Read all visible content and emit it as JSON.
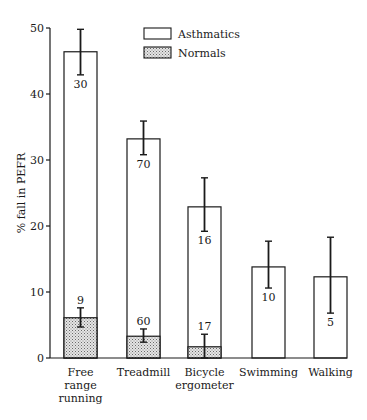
{
  "chart_data": {
    "type": "bar",
    "title": "",
    "xlabel": "",
    "ylabel": "% fall in PEFR",
    "ylim": [
      0,
      50
    ],
    "yticks": [
      0,
      10,
      20,
      30,
      40,
      50
    ],
    "grid": false,
    "legend_position": "top-center",
    "categories": [
      [
        "Free",
        "range",
        "running"
      ],
      [
        "Treadmill"
      ],
      [
        "Bicycle",
        "ergometer"
      ],
      [
        "Swimming"
      ],
      [
        "Walking"
      ]
    ],
    "category_names": [
      "Free range running",
      "Treadmill",
      "Bicycle ergometer",
      "Swimming",
      "Walking"
    ],
    "series": [
      {
        "name": "Asthmatics",
        "fill": "white",
        "values": [
          46.4,
          33.2,
          22.9,
          13.8,
          12.3
        ],
        "error_high": [
          49.8,
          35.9,
          27.3,
          17.7,
          18.3
        ],
        "error_low": [
          42.9,
          30.8,
          19.2,
          10.6,
          6.8
        ],
        "n": [
          "30",
          "70",
          "16",
          "10",
          "5"
        ]
      },
      {
        "name": "Normals",
        "fill": "stippled",
        "values": [
          6.1,
          3.3,
          1.7,
          null,
          null
        ],
        "error_high": [
          7.6,
          4.4,
          3.6,
          null,
          null
        ],
        "error_low": [
          4.7,
          2.4,
          0.0,
          null,
          null
        ],
        "n": [
          "9",
          "60",
          "17",
          null,
          null
        ]
      }
    ]
  },
  "legend": {
    "items": [
      {
        "label": "Asthmatics",
        "fill": "white"
      },
      {
        "label": "Normals",
        "fill": "stippled"
      }
    ]
  },
  "colors": {
    "ink": "#1a1a1a",
    "background": "#ffffff",
    "stipple_bg": "#e4e4e4",
    "stipple_dot": "#6a6a6a"
  }
}
